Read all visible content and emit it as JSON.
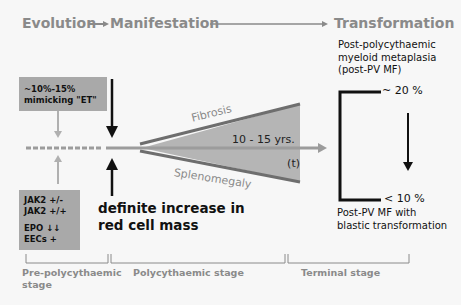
{
  "header": {
    "evolution": "Evolution",
    "arrow1": "→",
    "manifestation": "Manifestation",
    "transformation": "Transformation"
  },
  "left_boxes": {
    "top": [
      "~10%-15%",
      "mimicking \"ET\""
    ],
    "bottom": [
      "JAK2 +/-",
      "JAK2 +/+",
      "",
      "EPO ↓↓",
      "EECs +"
    ]
  },
  "center": {
    "fibrosis": "Fibrosis",
    "splenomegaly": "Splenomegaly",
    "duration": "10 - 15 yrs.",
    "time": "(t)",
    "increase_line1": "definite increase in",
    "increase_line2": "red cell mass"
  },
  "right": {
    "top_label": [
      "Post-polycythaemic",
      "myeloid metaplasia",
      "(post-PV MF)"
    ],
    "top_pct": "~ 20 %",
    "bottom_pct": "< 10 %",
    "bottom_label": [
      "Post-PV MF with",
      "blastic transformation"
    ]
  },
  "stages": {
    "pre": [
      "Pre-polycythaemic",
      "stage"
    ],
    "poly": "Polycythaemic stage",
    "terminal": "Terminal stage"
  },
  "colors": {
    "header_gray": "#8a8a8a",
    "box_gray": "#a9a9a9",
    "wedge_fill": "#b5b5b5",
    "wedge_edge": "#6e6e6e",
    "axis_gray": "#9c9c9c",
    "text_dark": "#111111"
  }
}
